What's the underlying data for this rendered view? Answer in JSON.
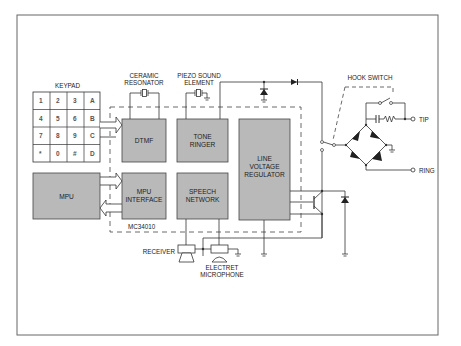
{
  "diagram": {
    "chip_label": "MC34010",
    "keypad": {
      "title": "KEYPAD",
      "keys": [
        [
          "1",
          "2",
          "3",
          "A"
        ],
        [
          "4",
          "5",
          "6",
          "B"
        ],
        [
          "7",
          "8",
          "9",
          "C"
        ],
        [
          "*",
          "0",
          "#",
          "D"
        ]
      ]
    },
    "blocks": {
      "dtmf": "DTMF",
      "tone_ringer": [
        "TONE",
        "RINGER"
      ],
      "line_voltage_regulator": [
        "LINE",
        "VOLTAGE",
        "REGULATOR"
      ],
      "mpu": "MPU",
      "mpu_interface": [
        "MPU",
        "INTERFACE"
      ],
      "speech_network": [
        "SPEECH",
        "NETWORK"
      ]
    },
    "components": {
      "ceramic_resonator": [
        "CERAMIC",
        "RESONATOR"
      ],
      "piezo": [
        "PIEZO SOUND",
        "ELEMENT"
      ],
      "hook_switch": "HOOK SWITCH",
      "receiver": "RECEIVER",
      "microphone": [
        "ELECTRET",
        "MICROPHONE"
      ],
      "tip": "TIP",
      "ring": "RING"
    },
    "colors": {
      "block_fill": "#b9b9b9",
      "line": "#333333",
      "frame": "#555555"
    }
  }
}
